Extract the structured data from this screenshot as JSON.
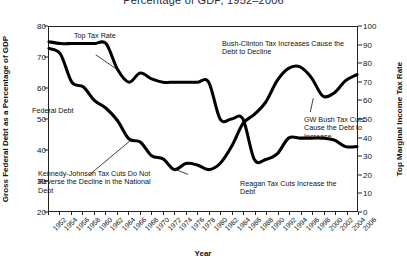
{
  "chart_data": {
    "type": "line",
    "title": "Percentage of GDP, 1952–2006",
    "xlabel": "Year",
    "ylabel": "Gross Federal Debt as a Percentage of GDP",
    "ylabel_right": "Top Marginal Income Tax Rate",
    "xlim": [
      1952,
      2006
    ],
    "ylim": [
      20,
      80
    ],
    "ylim_right": [
      0,
      100
    ],
    "grid": false,
    "legend": "none",
    "x": [
      1952,
      1954,
      1956,
      1958,
      1960,
      1962,
      1964,
      1966,
      1968,
      1970,
      1972,
      1974,
      1976,
      1978,
      1980,
      1982,
      1984,
      1986,
      1988,
      1990,
      1992,
      1994,
      1996,
      1998,
      2000,
      2002,
      2004,
      2006
    ],
    "xtick_labels": [
      "1952",
      "1954",
      "1956",
      "1958",
      "1960",
      "1962",
      "1964",
      "1966",
      "1968",
      "1970",
      "1972",
      "1974",
      "1976",
      "1978",
      "1980",
      "1982",
      "1984",
      "1986",
      "1988",
      "1990",
      "1992",
      "1994",
      "1996",
      "1998",
      "2000",
      "2002",
      "2004",
      "2006"
    ],
    "ytick_labels_left": [
      "80",
      "70",
      "60",
      "50",
      "40",
      "30",
      "20"
    ],
    "ytick_values_left": [
      80,
      70,
      60,
      50,
      40,
      30,
      20
    ],
    "ytick_labels_right": [
      "100",
      "90",
      "80",
      "70",
      "60",
      "50",
      "40",
      "30",
      "20",
      "10",
      "0"
    ],
    "ytick_values_right": [
      100,
      90,
      80,
      70,
      60,
      50,
      40,
      30,
      20,
      10,
      0
    ],
    "series": [
      {
        "name": "Federal Debt",
        "axis": "left",
        "values": [
          73.0,
          71.2,
          62.0,
          60.5,
          56.0,
          53.5,
          49.5,
          43.5,
          42.5,
          38.0,
          37.0,
          33.5,
          35.5,
          35.0,
          33.5,
          35.5,
          41.0,
          48.5,
          51.5,
          55.5,
          62.5,
          66.5,
          67.0,
          63.5,
          57.5,
          58.5,
          62.5,
          64.5
        ]
      },
      {
        "name": "Top Tax Rate",
        "axis": "right",
        "values": [
          92.0,
          91.0,
          91.0,
          91.0,
          91.0,
          91.0,
          77.0,
          70.0,
          75.0,
          71.8,
          70.0,
          70.0,
          70.0,
          70.0,
          70.0,
          50.0,
          50.0,
          50.0,
          28.0,
          28.0,
          31.0,
          39.6,
          39.6,
          39.6,
          39.6,
          38.6,
          35.0,
          35.0
        ]
      }
    ],
    "annotations": [
      {
        "id": "top-tax-rate",
        "text": "Top Tax Rate"
      },
      {
        "id": "federal-debt",
        "text": "Federal Debt"
      },
      {
        "id": "bush-clinton",
        "text": "Bush-Clinton Tax Increases Cause the\nDebt to Decline"
      },
      {
        "id": "gw-bush",
        "text": "GW Bush Tax Cuts\nCause the Debt to\nIncrease"
      },
      {
        "id": "kennedy-johnson",
        "text": "Kennedy-Johnson Tax Cuts Do Not\nReverse the Decline in the National\nDebt"
      },
      {
        "id": "reagan",
        "text": "Reagan Tax Cuts Increase the\nDebt"
      }
    ]
  }
}
